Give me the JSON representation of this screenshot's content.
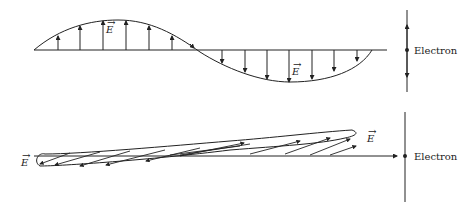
{
  "top_panel": {
    "title": "Linearly polarized wave",
    "field_label": "E",
    "field_label_2": "E",
    "electron_label": "Electron",
    "electron_motion": "oscillates up and down",
    "up_arrows_x": [
      58,
      80,
      103,
      126,
      149,
      172,
      195
    ],
    "down_arrows_x": [
      222,
      245,
      267,
      289,
      312,
      334,
      357
    ]
  },
  "bottom_panel": {
    "title": "Elliptical / drifting field",
    "field_label_left": "E",
    "field_label_right": "E",
    "electron_label": "Electron",
    "electron_motion": "pushed along propagation"
  },
  "colors": {
    "line": "#222222",
    "background": "#ffffff"
  }
}
